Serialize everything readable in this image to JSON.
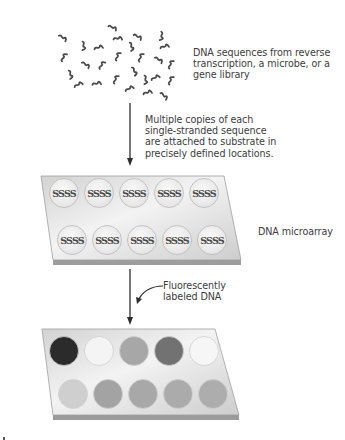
{
  "diagram": {
    "steps": [
      {
        "id": "source",
        "label_lines": [
          "DNA sequences from reverse",
          "transcription, a microbe, or a",
          "gene library"
        ]
      },
      {
        "id": "attach",
        "label_lines": [
          "Multiple copies of each",
          "single-stranded sequence",
          "are attached to substrate in",
          "precisely defined locations."
        ]
      },
      {
        "id": "microarray",
        "label": "DNA microarray",
        "spot_glyph": "SSSS",
        "rows": 2,
        "spots_per_row": 5
      },
      {
        "id": "hybridize",
        "label_lines": [
          "Fluorescently",
          "labeled DNA"
        ]
      },
      {
        "id": "result",
        "label": "",
        "spot_colors": [
          [
            "#2b2b2b",
            "#f4f4f4",
            "#a7a7a7",
            "#727272",
            "#f6f6f6"
          ],
          [
            "#cfcfcf",
            "#a3a3a3",
            "#a8a8a8",
            "#ababab",
            "#adadad"
          ]
        ]
      }
    ]
  },
  "colors": {
    "text": "#3c3c3c",
    "arrow": "#2e2e2e",
    "squiggle": "#4a4a4a",
    "slide_top_light": "#f2f2f2",
    "slide_top_dark": "#cfcfcf",
    "slide_edge": "#9a9a9a",
    "spot_fill": "#f3f3f3",
    "spot_stroke": "#b8b8b8"
  }
}
